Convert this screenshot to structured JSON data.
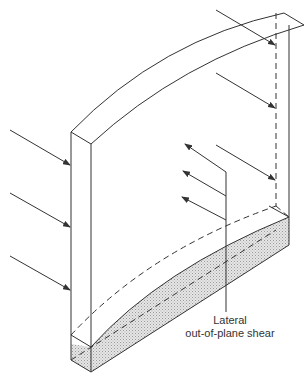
{
  "diagram": {
    "label": {
      "line1": "Lateral",
      "line2": "out-of-plane shear"
    },
    "colors": {
      "stroke": "#333333",
      "hatch_fill": "#d9d9d9",
      "background": "#ffffff"
    },
    "elements": {
      "wall": "curved-top wall panel (isometric)",
      "applied_loads_left": 3,
      "applied_loads_right": 3,
      "reaction_arrows": 3,
      "shaded_region": "deformed base section (hatched)"
    }
  }
}
